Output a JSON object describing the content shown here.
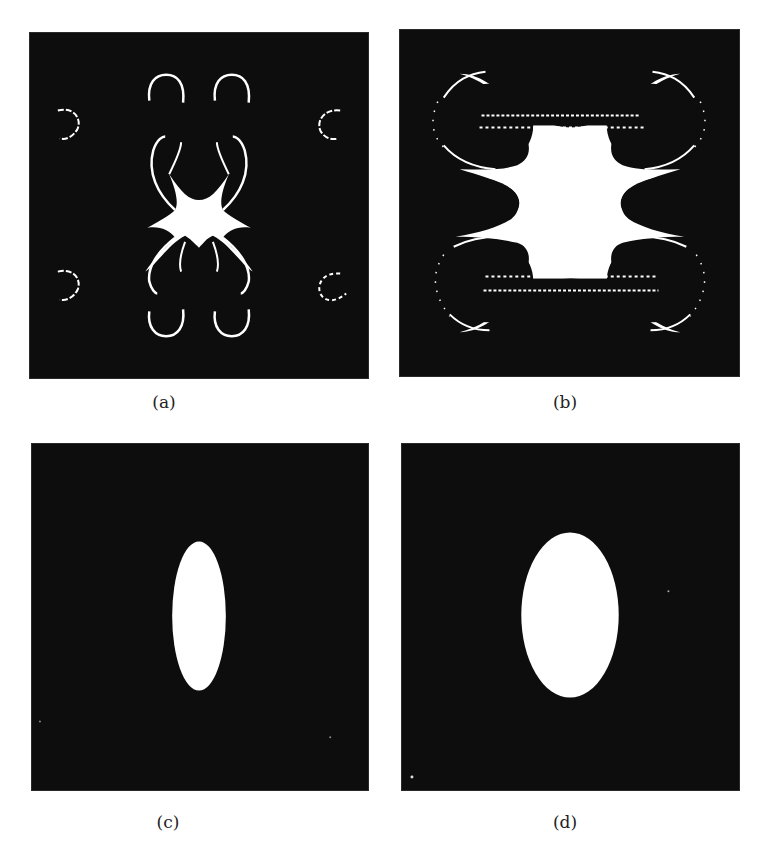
{
  "figure": {
    "panels": [
      {
        "id": "a",
        "caption": "(a)",
        "description": "Star-shaped white region at center with eight curved lobe arcs and four small outer C-shaped arcs on black background"
      },
      {
        "id": "b",
        "caption": "(b)",
        "description": "Large white cross-shaped region with four cusped arms and dotted horizontal bands above and below the center"
      },
      {
        "id": "c",
        "caption": "(c)",
        "description": "Narrow vertical white ellipse on black background"
      },
      {
        "id": "d",
        "caption": "(d)",
        "description": "Wider vertical white ellipse on black background"
      }
    ]
  },
  "colors": {
    "background": "#0d0d0d",
    "foreground": "#ffffff",
    "page": "#ffffff",
    "caption_text": "#222222"
  }
}
